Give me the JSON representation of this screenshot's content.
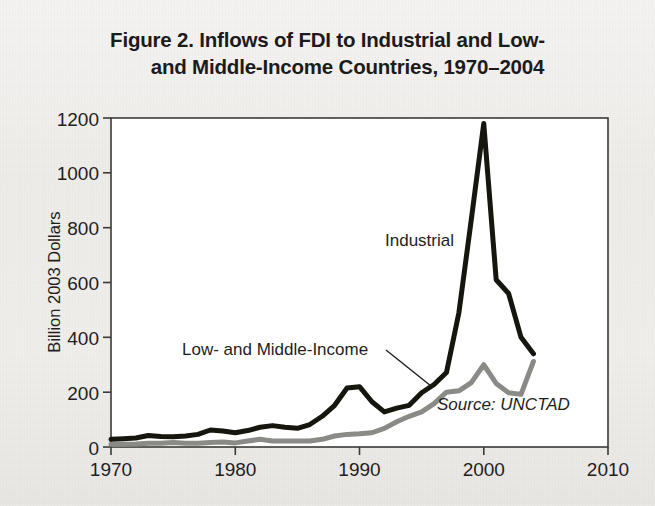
{
  "figure": {
    "title_line1": "Figure 2. Inflows of FDI to Industrial and Low-",
    "title_line2": "and Middle-Income Countries, 1970–2004",
    "source_note": "Source: UNCTAD"
  },
  "labels": {
    "industrial": "Industrial",
    "low_middle": "Low- and Middle-Income",
    "y_axis": "Billion 2003 Dollars"
  },
  "colors": {
    "industrial_line": "#16160f",
    "low_middle_line": "#8a8a87",
    "axis": "#3a3a38",
    "text": "#1e1e1e",
    "plot_background": "#ffffff",
    "page_background": "#f2f0ee"
  },
  "chart_data": {
    "type": "line",
    "title": "Figure 2. Inflows of FDI to Industrial and Low- and Middle-Income Countries, 1970–2004",
    "xlabel": "",
    "ylabel": "Billion 2003 Dollars",
    "xlim": [
      1970,
      2010
    ],
    "ylim": [
      0,
      1200
    ],
    "xticks": [
      1970,
      1980,
      1990,
      2000,
      2010
    ],
    "yticks": [
      0,
      200,
      400,
      600,
      800,
      1000,
      1200
    ],
    "xtick_labels": [
      "1970",
      "1980",
      "1990",
      "2000",
      "2010"
    ],
    "ytick_labels": [
      "0",
      "200",
      "400",
      "600",
      "800",
      "1000",
      "1200"
    ],
    "grid": false,
    "legend": "inline-annotations",
    "annotations": [
      {
        "text": "Industrial",
        "x": 1998.0,
        "y": 760
      },
      {
        "text": "Low- and Middle-Income",
        "x": 1983.5,
        "y": 355
      },
      {
        "text": "Source: UNCTAD",
        "x": 2001.0,
        "y": 120
      }
    ],
    "x": [
      1970,
      1971,
      1972,
      1973,
      1974,
      1975,
      1976,
      1977,
      1978,
      1979,
      1980,
      1981,
      1982,
      1983,
      1984,
      1985,
      1986,
      1987,
      1988,
      1989,
      1990,
      1991,
      1992,
      1993,
      1994,
      1995,
      1996,
      1997,
      1998,
      1999,
      2000,
      2001,
      2002,
      2003,
      2004
    ],
    "series": [
      {
        "name": "Industrial",
        "color": "#16160f",
        "values": [
          28,
          30,
          33,
          42,
          38,
          37,
          40,
          46,
          62,
          58,
          52,
          60,
          72,
          78,
          72,
          68,
          82,
          112,
          152,
          215,
          220,
          165,
          128,
          142,
          152,
          198,
          228,
          272,
          490,
          830,
          1180,
          610,
          560,
          400,
          340
        ]
      },
      {
        "name": "Low- and Middle-Income",
        "color": "#8a8a87",
        "values": [
          10,
          10,
          11,
          14,
          14,
          16,
          14,
          14,
          16,
          18,
          15,
          22,
          28,
          22,
          22,
          22,
          22,
          28,
          40,
          46,
          48,
          52,
          68,
          92,
          112,
          128,
          158,
          200,
          205,
          235,
          300,
          232,
          198,
          192,
          312
        ]
      }
    ]
  }
}
